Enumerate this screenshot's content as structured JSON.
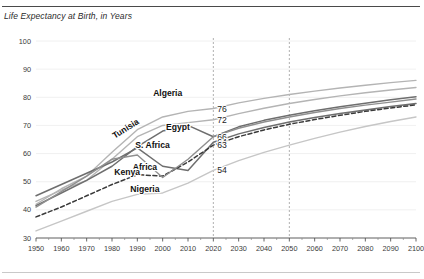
{
  "chart_data": {
    "type": "line",
    "title": "Life Expectancy at Birth, in Years",
    "xlabel": "",
    "ylabel": "",
    "xlim": [
      1950,
      2100
    ],
    "ylim": [
      30,
      100
    ],
    "ytick_step": 10,
    "xtick_step": 10,
    "grid": true,
    "legend": "inline-labels",
    "x": [
      1950,
      1960,
      1970,
      1980,
      1990,
      2000,
      2010,
      2020,
      2030,
      2040,
      2050,
      2060,
      2070,
      2080,
      2090,
      2100
    ],
    "yticks": [
      "30",
      "40",
      "50",
      "60",
      "70",
      "80",
      "90",
      "100"
    ],
    "xticks": [
      "1950",
      "1960",
      "1970",
      "1980",
      "1990",
      "2000",
      "2010",
      "2020",
      "2030",
      "2040",
      "2050",
      "2060",
      "2070",
      "2080",
      "2090",
      "2100"
    ],
    "reference_lines": [
      {
        "x": 2020,
        "style": "dotted"
      },
      {
        "x": 2050,
        "style": "dotted"
      }
    ],
    "value_labels": [
      {
        "series": "Tunisia",
        "value": 76,
        "at_x": 2020
      },
      {
        "series": "Algeria",
        "value": 72,
        "at_x": 2020
      },
      {
        "series": "Egypt",
        "value": 66,
        "at_x": 2020
      },
      {
        "series": "S. Africa",
        "value": 64,
        "at_x": 2020
      },
      {
        "series": "Africa",
        "value": 63,
        "at_x": 2020
      },
      {
        "series": "Nigeria",
        "value": 54,
        "at_x": 2020
      }
    ],
    "series": [
      {
        "name": "Tunisia",
        "color": "#b4b4b4",
        "style": "solid",
        "width": 1.4,
        "label_x": 1986,
        "label_y": 68,
        "label_rotate": -32,
        "values": [
          42.0,
          47.5,
          52.0,
          60.5,
          68.5,
          73.0,
          75.0,
          76.0,
          78.0,
          79.6,
          81.0,
          82.2,
          83.3,
          84.3,
          85.2,
          86.0
        ]
      },
      {
        "name": "Algeria",
        "color": "#b4b4b4",
        "style": "solid",
        "width": 1.4,
        "label_x": 2002,
        "label_y": 80.5,
        "label_rotate": 0,
        "values": [
          43.0,
          47.0,
          50.5,
          58.0,
          66.0,
          70.0,
          71.0,
          72.0,
          74.2,
          76.1,
          77.8,
          79.2,
          80.5,
          81.6,
          82.6,
          83.5
        ]
      },
      {
        "name": "Egypt",
        "color": "#6e6e6e",
        "style": "solid",
        "width": 1.5,
        "label_x": 2006,
        "label_y": 68.5,
        "label_rotate": 0,
        "values": [
          41.5,
          46.0,
          50.5,
          55.5,
          62.5,
          68.0,
          70.0,
          66.0,
          69.5,
          71.8,
          73.6,
          75.2,
          76.6,
          77.9,
          79.1,
          80.2
        ]
      },
      {
        "name": "S. Africa",
        "color": "#6e6e6e",
        "style": "solid",
        "width": 1.5,
        "label_x": 1996,
        "label_y": 62.0,
        "label_rotate": 0,
        "values": [
          45.0,
          49.0,
          53.0,
          57.0,
          62.0,
          55.5,
          54.0,
          64.0,
          67.0,
          69.3,
          71.2,
          72.8,
          74.2,
          75.5,
          76.7,
          77.8
        ]
      },
      {
        "name": "Africa",
        "color": "#3a3a3a",
        "style": "dashed",
        "width": 1.5,
        "label_x": 1993,
        "label_y": 54.0,
        "label_rotate": 0,
        "values": [
          37.5,
          41.0,
          45.0,
          49.0,
          52.5,
          52.0,
          57.0,
          63.0,
          66.0,
          68.4,
          70.4,
          72.1,
          73.6,
          75.0,
          76.2,
          77.3
        ]
      },
      {
        "name": "Kenya",
        "color": "#8f8f8f",
        "style": "solid",
        "width": 1.4,
        "label_x": 1986,
        "label_y": 52.5,
        "label_rotate": 0,
        "values": [
          41.0,
          46.5,
          52.0,
          58.0,
          59.5,
          51.5,
          58.0,
          66.0,
          69.0,
          71.2,
          73.0,
          74.6,
          76.0,
          77.2,
          78.3,
          79.4
        ]
      },
      {
        "name": "Nigeria",
        "color": "#c6c6c6",
        "style": "solid",
        "width": 1.4,
        "label_x": 1993,
        "label_y": 46.5,
        "label_rotate": 0,
        "values": [
          32.5,
          36.0,
          39.5,
          43.0,
          45.5,
          46.0,
          49.5,
          54.0,
          57.5,
          60.4,
          63.0,
          65.4,
          67.6,
          69.6,
          71.4,
          73.0
        ]
      }
    ]
  }
}
